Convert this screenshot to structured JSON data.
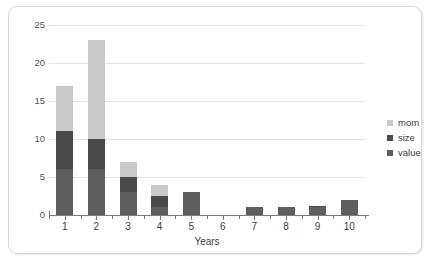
{
  "chart_data": {
    "type": "bar",
    "stacked": true,
    "title": "",
    "subtitle": "",
    "xlabel": "Years",
    "ylabel": "",
    "categories": [
      "1",
      "2",
      "3",
      "4",
      "5",
      "6",
      "7",
      "8",
      "9",
      "10"
    ],
    "series": [
      {
        "name": "value",
        "color": "#5e5e5e",
        "values": [
          6,
          6,
          3,
          1,
          3,
          0,
          1,
          1,
          1,
          2
        ]
      },
      {
        "name": "size",
        "color": "#4a4a4a",
        "values": [
          5,
          4,
          2,
          1.5,
          0,
          0,
          0,
          0,
          0.2,
          0
        ]
      },
      {
        "name": "mom",
        "color": "#c9c9c9",
        "values": [
          6,
          13,
          2,
          1.5,
          0,
          0,
          0,
          0,
          0,
          0
        ]
      }
    ],
    "totals": [
      17,
      23,
      7,
      4,
      3,
      0,
      1,
      1,
      1.2,
      2
    ],
    "ylim": [
      0,
      25
    ],
    "ytick_labels": [
      "0",
      "5",
      "10",
      "15",
      "20",
      "25"
    ],
    "ytick_values": [
      0,
      5,
      10,
      15,
      20,
      25
    ],
    "xtick_labels": [
      "1",
      "2",
      "3",
      "4",
      "5",
      "6",
      "7",
      "8",
      "9",
      "10"
    ],
    "grid": true,
    "grid_color": "#e4e4e4",
    "legend_position": "right",
    "legend_entries": [
      {
        "label": "mom",
        "color": "#c9c9c9"
      },
      {
        "label": "size",
        "color": "#4a4a4a"
      },
      {
        "label": "value",
        "color": "#5e5e5e"
      }
    ],
    "background_color": "#ffffff",
    "border_color": "#d8d8d8",
    "axis_color": "#7a7a7a"
  }
}
